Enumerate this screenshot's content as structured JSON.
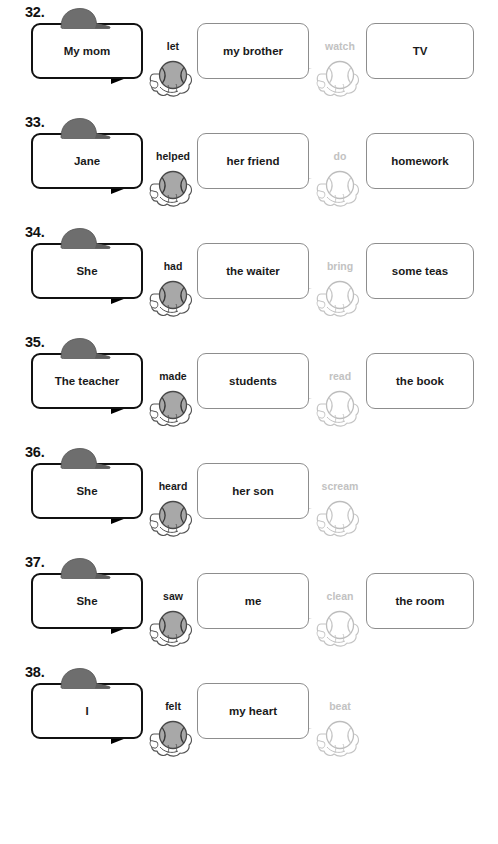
{
  "worksheet": {
    "colors": {
      "subject_border": "#111111",
      "object_border": "#8d8d8d",
      "tail_dark": "#000000",
      "tail_light": "#d4d4d4",
      "cap_fill": "#6e6e6e",
      "ball_active_fill": "#a8a8a8",
      "ball_faded_fill": "#ffffff",
      "verb_active": "#1a1a1a",
      "verb_faded": "#c2c2c2",
      "text": "#1a1a1a"
    },
    "icons": {
      "cap": "baseball-cap-icon",
      "ball_active": "baseball-in-glove-icon",
      "ball_faded": "baseball-in-glove-faded-icon"
    },
    "rows": [
      {
        "number": "32.",
        "subject": "My mom",
        "verb1": "let",
        "object1": "my brother",
        "verb2": "watch",
        "object2": "TV",
        "has_object2": true
      },
      {
        "number": "33.",
        "subject": "Jane",
        "verb1": "helped",
        "object1": "her friend",
        "verb2": "do",
        "object2": "homework",
        "has_object2": true
      },
      {
        "number": "34.",
        "subject": "She",
        "verb1": "had",
        "object1": "the waiter",
        "verb2": "bring",
        "object2": "some teas",
        "has_object2": true
      },
      {
        "number": "35.",
        "subject": "The teacher",
        "verb1": "made",
        "object1": "students",
        "verb2": "read",
        "object2": "the book",
        "has_object2": true
      },
      {
        "number": "36.",
        "subject": "She",
        "verb1": "heard",
        "object1": "her son",
        "verb2": "scream",
        "object2": "",
        "has_object2": false
      },
      {
        "number": "37.",
        "subject": "She",
        "verb1": "saw",
        "object1": "me",
        "verb2": "clean",
        "object2": "the room",
        "has_object2": true
      },
      {
        "number": "38.",
        "subject": "I",
        "verb1": "felt",
        "object1": "my heart",
        "verb2": "beat",
        "object2": "",
        "has_object2": false
      }
    ]
  }
}
